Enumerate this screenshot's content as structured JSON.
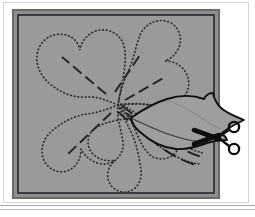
{
  "figure": {
    "caption": "",
    "colors": {
      "page_background": "#ffffff",
      "fabric_fill": "#9a9a9a",
      "fabric_shadow": "#8c8c8c",
      "border_outer": "#6e6e6e",
      "border_inner": "#2b2b2b",
      "stitch_dots": "#2a2a2a",
      "dash_lines": "#262626",
      "cut_line": "#111111",
      "scissors": "#0d0d0d",
      "hairline_rule": "#9f9f9f",
      "flap_fill": "#9e9e9e"
    },
    "panel": {
      "x": 13,
      "y": 10,
      "width": 206,
      "height": 188,
      "border_width": 2,
      "label": "fabric-square"
    },
    "rules": [
      {
        "name": "bottom-rule-upper",
        "y": 205
      },
      {
        "name": "bottom-rule-lower",
        "y": 209
      }
    ],
    "flower": {
      "center_x": 118,
      "center_y": 105,
      "petal_count": 5,
      "outline_style": "dotted",
      "petals": [
        {
          "id": "petal-upper-left",
          "angle": 208
        },
        {
          "id": "petal-upper-right",
          "angle": 290
        },
        {
          "id": "petal-right",
          "angle": 355
        },
        {
          "id": "petal-lower-right",
          "angle": 60
        },
        {
          "id": "petal-lower-left",
          "angle": 140
        }
      ],
      "dash_lines": [
        {
          "id": "dash-upper-left",
          "x1": 104,
          "y1": 92,
          "x2": 62,
          "y2": 58
        },
        {
          "id": "dash-upper-right",
          "x1": 114,
          "y1": 90,
          "x2": 142,
          "y2": 53
        },
        {
          "id": "dash-right",
          "x1": 124,
          "y1": 100,
          "x2": 163,
          "y2": 78
        },
        {
          "id": "dash-lower-left",
          "x1": 110,
          "y1": 112,
          "x2": 70,
          "y2": 152
        },
        {
          "id": "dash-lower-right",
          "x1": 124,
          "y1": 112,
          "x2": 168,
          "y2": 140
        }
      ]
    },
    "cut_flap": {
      "id": "lifted-fabric-flap",
      "description": "petal flap cut open and folded to the right beyond panel edge",
      "tip_x": 243,
      "tip_y": 122
    },
    "scissors": {
      "id": "scissors",
      "pivot_x": 218,
      "pivot_y": 137,
      "blade_direction": "left",
      "handle_ring_count": 2
    }
  }
}
